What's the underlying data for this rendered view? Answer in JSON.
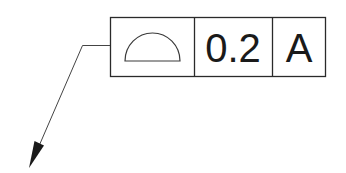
{
  "diagram": {
    "type": "gdt-feature-control-frame",
    "colors": {
      "line": "#2a2a2a",
      "text": "#1a1a1a",
      "background": "#ffffff"
    },
    "frame": {
      "cells": [
        {
          "name": "geometric-characteristic",
          "symbol": "profile-of-a-surface-icon",
          "text": ""
        },
        {
          "name": "tolerance-value",
          "text": "0.2"
        },
        {
          "name": "datum-reference",
          "text": "A"
        }
      ]
    },
    "leader": {
      "arrow": "filled-arrowhead",
      "direction": "down-left"
    }
  }
}
